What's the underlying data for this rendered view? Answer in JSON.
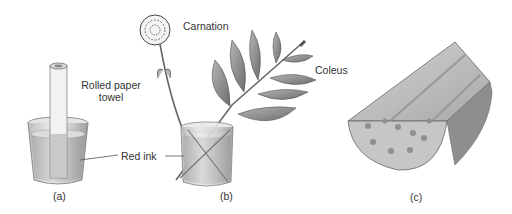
{
  "panels": [
    {
      "id": "a",
      "caption": "(a)",
      "labels": {
        "towel_line1": "Rolled paper",
        "towel_line2": "towel"
      }
    },
    {
      "id": "b",
      "caption": "(b)",
      "labels": {
        "flower": "Carnation",
        "plant": "Coleus",
        "ink": "Red ink"
      }
    },
    {
      "id": "c",
      "caption": "(c)"
    }
  ],
  "colors": {
    "glass": "#d9d9d9",
    "liquid": "#c4c4c4",
    "leaf": "#8a8a8a",
    "stem_section": "#b9b9b9",
    "text": "#333333"
  }
}
